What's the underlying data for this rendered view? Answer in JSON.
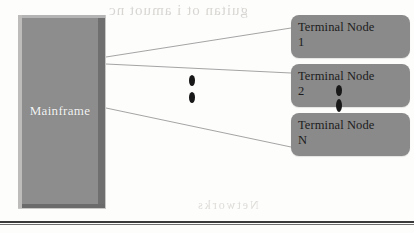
{
  "diagram": {
    "mainframe": {
      "label": "Mainframe",
      "fill_color": "#8d8d8d",
      "label_color": "#f4f4f4"
    },
    "nodes": [
      {
        "label": "Terminal Node\n1",
        "name": "terminal-node-1"
      },
      {
        "label": "Terminal Node\n2",
        "name": "terminal-node-2"
      },
      {
        "label": "Terminal Node\nN",
        "name": "terminal-node-n"
      }
    ],
    "node_fill_color": "#8a8a8a",
    "node_label_color": "#1c1c1c",
    "connector_color": "#9a9a9a",
    "ellipsis": {
      "between_nodes_count": 2,
      "overlay_count": 2,
      "dot_color": "#181818"
    },
    "rule_color": "#3a3a3a"
  },
  "background_bleed": {
    "top": "guitan  ot i amuot nc",
    "middle": "nodes",
    "lower": "of the",
    "bottom": "Networks"
  }
}
